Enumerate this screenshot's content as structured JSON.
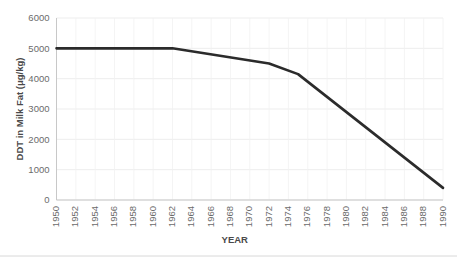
{
  "chart_data": {
    "type": "line",
    "title": "",
    "xlabel": "YEAR",
    "ylabel": "DDT in Milk Fat (μg/kg)",
    "xlim": [
      1950,
      1990
    ],
    "ylim": [
      0,
      6000
    ],
    "grid": true,
    "legend": "none",
    "y_ticks": [
      0,
      1000,
      2000,
      3000,
      4000,
      5000,
      6000
    ],
    "y_tick_labels": [
      "0",
      "1000",
      "2000",
      "3000",
      "4000",
      "5000",
      "6000"
    ],
    "x_ticks": [
      1950,
      1952,
      1954,
      1956,
      1958,
      1960,
      1962,
      1964,
      1966,
      1968,
      1970,
      1972,
      1974,
      1976,
      1978,
      1980,
      1982,
      1984,
      1986,
      1988,
      1990
    ],
    "x_tick_labels": [
      "1950",
      "1952",
      "1954",
      "1956",
      "1958",
      "1960",
      "1962",
      "1964",
      "1966",
      "1968",
      "1970",
      "1972",
      "1974",
      "1976",
      "1978",
      "1980",
      "1982",
      "1984",
      "1986",
      "1988",
      "1990"
    ],
    "series": [
      {
        "name": "DDT in Milk Fat",
        "color": "#2b2b2b",
        "x": [
          1950,
          1962,
          1972,
          1975,
          1990
        ],
        "values": [
          5000,
          5000,
          4500,
          4150,
          400
        ]
      }
    ]
  },
  "axis": {
    "y_title": "DDT in Milk Fat (μg/kg)",
    "x_title": "YEAR"
  }
}
